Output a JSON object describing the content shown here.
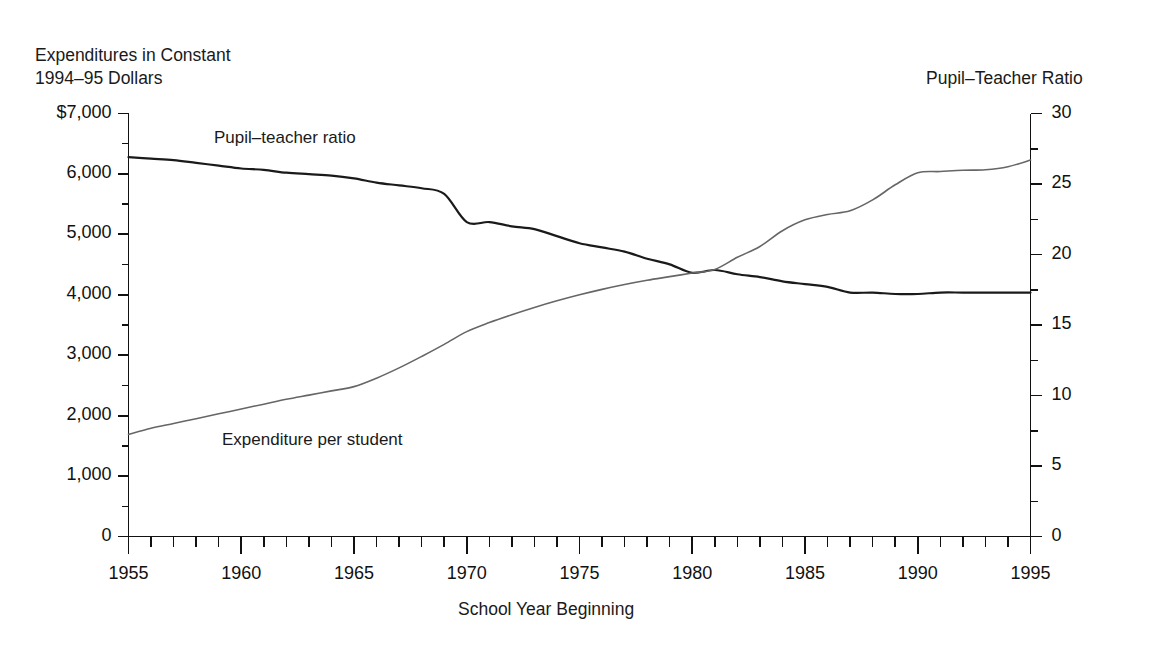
{
  "chart_data": {
    "type": "line",
    "title": "",
    "xlabel": "School Year Beginning",
    "left_axis_title": "Expenditures in Constant\n1994–95 Dollars",
    "right_axis_title": "Pupil–Teacher Ratio",
    "grid": false,
    "legend_position": "inline-annotations",
    "xlim": [
      1955,
      1995
    ],
    "xticks": [
      1955,
      1960,
      1965,
      1970,
      1975,
      1980,
      1985,
      1990,
      1995
    ],
    "xticklabels": [
      "1955",
      "1960",
      "1965",
      "1970",
      "1975",
      "1980",
      "1985",
      "1990",
      "1995"
    ],
    "x_minor_tick_interval": 1,
    "ylim_left": [
      0,
      7000
    ],
    "yticks_left": [
      0,
      1000,
      2000,
      3000,
      4000,
      5000,
      6000,
      7000
    ],
    "yticklabels_left": [
      "0",
      "1,000",
      "2,000",
      "3,000",
      "4,000",
      "5,000",
      "6,000",
      "$7,000"
    ],
    "y_left_minor_tick_interval": 500,
    "ylim_right": [
      0,
      30
    ],
    "yticks_right": [
      0,
      5,
      10,
      15,
      20,
      25,
      30
    ],
    "yticklabels_right": [
      "0",
      "5",
      "10",
      "15",
      "20",
      "25",
      "30"
    ],
    "y_right_minor_tick_interval": 2.5,
    "x": [
      1955,
      1956,
      1957,
      1958,
      1959,
      1960,
      1961,
      1962,
      1963,
      1964,
      1965,
      1966,
      1967,
      1968,
      1969,
      1970,
      1971,
      1972,
      1973,
      1974,
      1975,
      1976,
      1977,
      1978,
      1979,
      1980,
      1981,
      1982,
      1983,
      1984,
      1985,
      1986,
      1987,
      1988,
      1989,
      1990,
      1991,
      1992,
      1993,
      1994,
      1995
    ],
    "series": [
      {
        "name": "Pupil–teacher ratio",
        "axis": "right",
        "color": "#1a1a1a",
        "line_width": 2.2,
        "label_text": "Pupil–teacher ratio",
        "values": [
          26.9,
          26.8,
          26.7,
          26.5,
          26.3,
          26.1,
          26.0,
          25.8,
          25.7,
          25.6,
          25.4,
          25.1,
          24.9,
          24.7,
          24.3,
          22.3,
          22.3,
          22.0,
          21.8,
          21.3,
          20.8,
          20.5,
          20.2,
          19.7,
          19.3,
          18.7,
          18.9,
          18.6,
          18.4,
          18.1,
          17.9,
          17.7,
          17.3,
          17.3,
          17.2,
          17.2,
          17.3,
          17.3,
          17.3,
          17.3,
          17.3
        ]
      },
      {
        "name": "Expenditure per student",
        "axis": "left",
        "color": "#666666",
        "line_width": 1.6,
        "label_text": "Expenditure per student",
        "values": [
          1690,
          1790,
          1870,
          1950,
          2030,
          2110,
          2190,
          2270,
          2340,
          2410,
          2480,
          2620,
          2790,
          2980,
          3180,
          3390,
          3540,
          3670,
          3790,
          3900,
          4000,
          4090,
          4170,
          4240,
          4300,
          4360,
          4420,
          4620,
          4800,
          5060,
          5240,
          5330,
          5390,
          5570,
          5820,
          6020,
          6040,
          6060,
          6070,
          6120,
          6230
        ]
      }
    ],
    "annotations": [
      {
        "text": "Pupil–teacher ratio",
        "x": 1961,
        "y": 28
      },
      {
        "text": "Expenditure per student",
        "x": 1961,
        "y": 1500
      }
    ]
  },
  "axis": {
    "left_title_line1": "Expenditures in Constant",
    "left_title_line2": "1994–95 Dollars",
    "right_title": "Pupil–Teacher Ratio",
    "x_title": "School Year Beginning"
  }
}
